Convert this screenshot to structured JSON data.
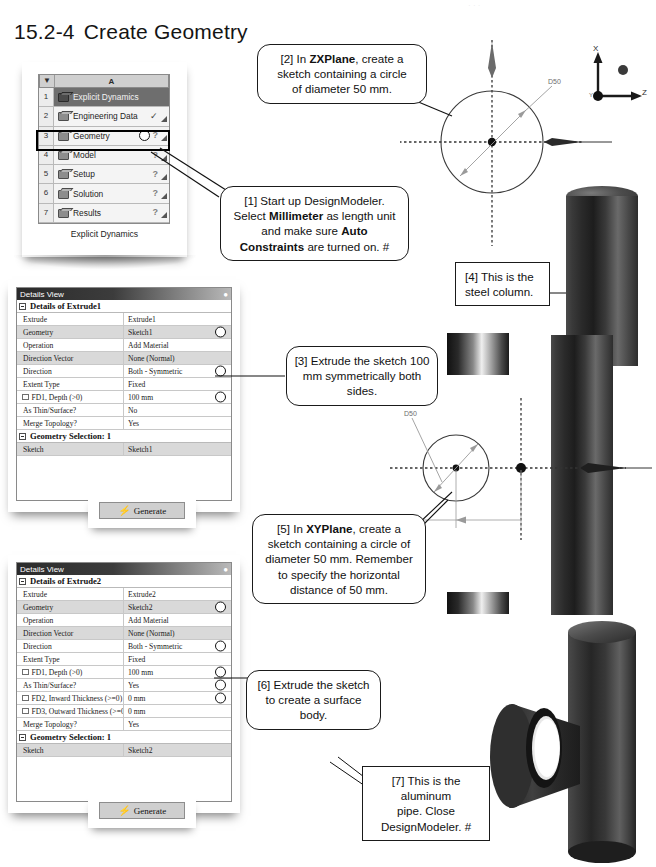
{
  "page": {
    "section_number": "15.2-4",
    "section_title": "Create Geometry",
    "header_marks": "· ·   ·"
  },
  "schematic": {
    "column_header": "A",
    "dropdown_icon": "caret-down-icon",
    "caption": "Explicit Dynamics",
    "rows": [
      {
        "index": "1",
        "label": "Explicit Dynamics",
        "status": "",
        "icon": "analysis-system-icon"
      },
      {
        "index": "2",
        "label": "Engineering Data",
        "status": "✓",
        "icon": "engineering-data-icon"
      },
      {
        "index": "3",
        "label": "Geometry",
        "status": "?",
        "icon": "geometry-icon"
      },
      {
        "index": "4",
        "label": "Model",
        "status": "?",
        "icon": "model-icon"
      },
      {
        "index": "5",
        "label": "Setup",
        "status": "?",
        "icon": "setup-icon"
      },
      {
        "index": "6",
        "label": "Solution",
        "status": "?",
        "icon": "solution-icon"
      },
      {
        "index": "7",
        "label": "Results",
        "status": "?",
        "icon": "results-icon"
      }
    ]
  },
  "details1": {
    "title": "Details View",
    "pin_icon": "pin-icon",
    "section": "Details of Extrude1",
    "rows": [
      {
        "key": "Extrude",
        "value": "Extrude1",
        "mark": false,
        "checkbox": false,
        "alt": false
      },
      {
        "key": "Geometry",
        "value": "Sketch1",
        "mark": true,
        "checkbox": false,
        "alt": true
      },
      {
        "key": "Operation",
        "value": "Add Material",
        "mark": false,
        "checkbox": false,
        "alt": false
      },
      {
        "key": "Direction Vector",
        "value": "None (Normal)",
        "mark": false,
        "checkbox": false,
        "alt": true
      },
      {
        "key": "Direction",
        "value": "Both - Symmetric",
        "mark": true,
        "checkbox": false,
        "alt": false
      },
      {
        "key": "Extent Type",
        "value": "Fixed",
        "mark": false,
        "checkbox": false,
        "alt": false
      },
      {
        "key": "FD1,  Depth (>0)",
        "value": "100 mm",
        "mark": true,
        "checkbox": true,
        "alt": false
      },
      {
        "key": "As Thin/Surface?",
        "value": "No",
        "mark": false,
        "checkbox": false,
        "alt": false
      },
      {
        "key": "Merge Topology?",
        "value": "Yes",
        "mark": false,
        "checkbox": false,
        "alt": false
      }
    ],
    "section2": "Geometry Selection: 1",
    "rows2": [
      {
        "key": "Sketch",
        "value": "Sketch1",
        "mark": false,
        "checkbox": false,
        "alt": true
      }
    ]
  },
  "details2": {
    "title": "Details View",
    "pin_icon": "pin-icon",
    "section": "Details of Extrude2",
    "rows": [
      {
        "key": "Extrude",
        "value": "Extrude2",
        "mark": false,
        "checkbox": false,
        "alt": false
      },
      {
        "key": "Geometry",
        "value": "Sketch2",
        "mark": true,
        "checkbox": false,
        "alt": true
      },
      {
        "key": "Operation",
        "value": "Add Material",
        "mark": false,
        "checkbox": false,
        "alt": false
      },
      {
        "key": "Direction Vector",
        "value": "None (Normal)",
        "mark": false,
        "checkbox": false,
        "alt": true
      },
      {
        "key": "Direction",
        "value": "Both - Symmetric",
        "mark": true,
        "checkbox": false,
        "alt": false
      },
      {
        "key": "Extent Type",
        "value": "Fixed",
        "mark": false,
        "checkbox": false,
        "alt": false
      },
      {
        "key": "FD1,  Depth (>0)",
        "value": "100 mm",
        "mark": true,
        "checkbox": true,
        "alt": false
      },
      {
        "key": "As Thin/Surface?",
        "value": "Yes",
        "mark": true,
        "checkbox": false,
        "alt": false
      },
      {
        "key": "FD2,  Inward Thickness (>=0)",
        "value": "0 mm",
        "mark": true,
        "checkbox": true,
        "alt": false
      },
      {
        "key": "FD3,  Outward Thickness (>=0)",
        "value": "0 mm",
        "mark": false,
        "checkbox": true,
        "alt": false
      },
      {
        "key": "Merge Topology?",
        "value": "Yes",
        "mark": false,
        "checkbox": false,
        "alt": false
      }
    ],
    "section2": "Geometry Selection: 1",
    "rows2": [
      {
        "key": "Sketch",
        "value": "Sketch2",
        "mark": false,
        "checkbox": false,
        "alt": true
      }
    ]
  },
  "generate_top": {
    "label": "Generate",
    "icon": "lightning-bolt-icon"
  },
  "generate_bottom": {
    "label": "Generate",
    "icon": "lightning-bolt-icon"
  },
  "callouts": {
    "c1": {
      "parts": [
        {
          "t": "[1] Start up DesignModeler.",
          "b": false
        },
        {
          "t": "\n",
          "b": false
        },
        {
          "t": "Select ",
          "b": false
        },
        {
          "t": "Millimeter",
          "b": true
        },
        {
          "t": " as length unit",
          "b": false
        },
        {
          "t": "\n",
          "b": false
        },
        {
          "t": "and make sure ",
          "b": false
        },
        {
          "t": "Auto",
          "b": true
        },
        {
          "t": "\n",
          "b": false
        },
        {
          "t": "Constraints",
          "b": true
        },
        {
          "t": " are turned on. #",
          "b": false
        }
      ]
    },
    "c2": {
      "parts": [
        {
          "t": "[2] In ",
          "b": false
        },
        {
          "t": "ZXPlane",
          "b": true
        },
        {
          "t": ", create a",
          "b": false
        },
        {
          "t": "\n",
          "b": false
        },
        {
          "t": "sketch containing a circle",
          "b": false
        },
        {
          "t": "\n",
          "b": false
        },
        {
          "t": "of diameter 50 mm.",
          "b": false
        }
      ]
    },
    "c3": {
      "text": "[3] Extrude the sketch 100\nmm symmetrically both sides."
    },
    "c4": {
      "text": "[4] This is the\nsteel column."
    },
    "c5": {
      "parts": [
        {
          "t": "[5] In ",
          "b": false
        },
        {
          "t": "XYPlane",
          "b": true
        },
        {
          "t": ", create a",
          "b": false
        },
        {
          "t": "\n",
          "b": false
        },
        {
          "t": "sketch containing a circle of",
          "b": false
        },
        {
          "t": "\n",
          "b": false
        },
        {
          "t": "diameter 50 mm.  Remember",
          "b": false
        },
        {
          "t": "\n",
          "b": false
        },
        {
          "t": "to specify the horizontal",
          "b": false
        },
        {
          "t": "\n",
          "b": false
        },
        {
          "t": "distance of 50 mm.",
          "b": false
        }
      ]
    },
    "c6": {
      "text": "[6] Extrude the sketch\nto create a surface\nbody."
    },
    "c7": {
      "text": "[7] This is the aluminum\npipe.  Close\nDesignModeler. #"
    }
  },
  "sketch_top": {
    "diameter_label": "D50",
    "axis_x_label": "X",
    "axis_z_label": "Z",
    "axis_y_label": "Y"
  },
  "sketch_bottom": {
    "diameter_label": "D50",
    "distance_label": "50"
  },
  "colors": {
    "ink": "#111111",
    "panel_border": "#8a8a8a",
    "row_alt": "#d9d9d9",
    "title_bar": "#2b2b2b",
    "button_face": "#cfcfcf",
    "highlight_row": "#6e6e6e"
  }
}
